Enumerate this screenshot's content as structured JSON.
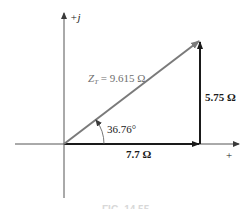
{
  "diagram": {
    "type": "impedance-diagram",
    "axes": {
      "imaginary_label": "+j",
      "real_label": "+"
    },
    "vectors": {
      "resistance": {
        "label": "7.7 Ω",
        "value": 7.7,
        "unit": "Ω",
        "color": "#1a1a1a"
      },
      "reactance": {
        "label": "5.75 Ω",
        "value": 5.75,
        "unit": "Ω",
        "color": "#1a1a1a"
      },
      "total_impedance": {
        "label": "Z_T = 9.615 Ω",
        "symbol": "Z",
        "subscript": "T",
        "equals_text": " = 9.615 Ω",
        "value": 9.615,
        "unit": "Ω",
        "color": "#7a7a7a"
      }
    },
    "angle": {
      "label": "36.76°",
      "value": 36.76,
      "unit": "°"
    },
    "caption": "FIG. 14.55"
  }
}
